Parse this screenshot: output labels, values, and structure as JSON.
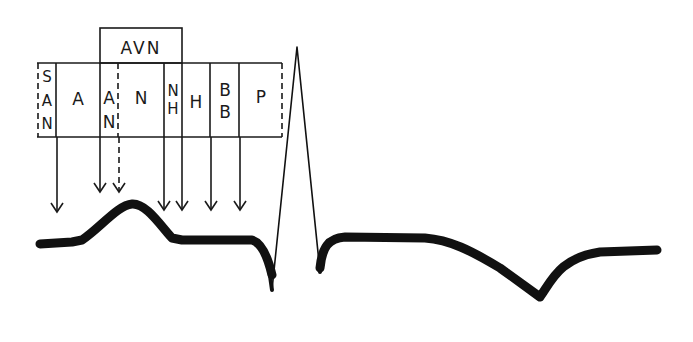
{
  "diagram": {
    "avn_label": "AVN",
    "regions": [
      {
        "id": "san",
        "lines": [
          "S",
          "A",
          "N"
        ]
      },
      {
        "id": "a",
        "lines": [
          "A"
        ]
      },
      {
        "id": "an",
        "lines": [
          "A",
          "N"
        ]
      },
      {
        "id": "n",
        "lines": [
          "N"
        ]
      },
      {
        "id": "nh",
        "lines": [
          "N",
          "H"
        ]
      },
      {
        "id": "h",
        "lines": [
          "H"
        ]
      },
      {
        "id": "bb",
        "lines": [
          "B",
          "B"
        ]
      },
      {
        "id": "p",
        "lines": [
          "P"
        ]
      }
    ],
    "arrows": [
      {
        "from_region": "san",
        "style": "solid"
      },
      {
        "from_region": "an",
        "style": "solid"
      },
      {
        "from_region": "an",
        "style": "dashed"
      },
      {
        "from_region": "n",
        "style": "solid"
      },
      {
        "from_region": "nh",
        "style": "solid"
      },
      {
        "from_region": "h",
        "style": "solid"
      },
      {
        "from_region": "bb",
        "style": "solid"
      }
    ],
    "waveform": {
      "segments": [
        "P wave",
        "PR segment",
        "QRS complex",
        "ST segment",
        "T wave (inverted)"
      ]
    },
    "colors": {
      "ink": "#1a1a1a",
      "background": "#ffffff"
    }
  }
}
